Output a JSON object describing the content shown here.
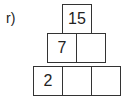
{
  "label": "r)",
  "pyramid": {
    "rows": [
      [
        "15"
      ],
      [
        "7",
        ""
      ],
      [
        "2",
        "",
        ""
      ]
    ]
  }
}
